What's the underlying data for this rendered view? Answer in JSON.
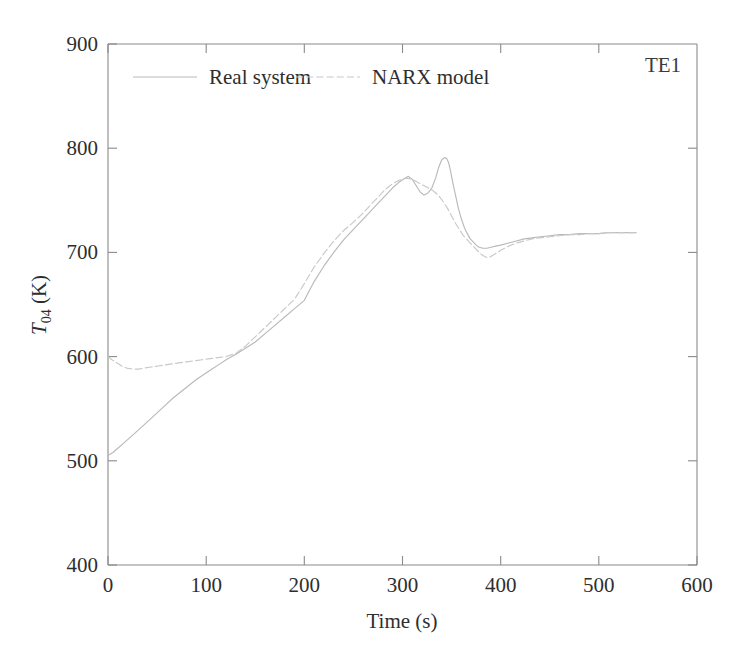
{
  "chart_data": {
    "type": "line",
    "title": "",
    "xlabel": "Time (s)",
    "ylabel": "T_04 (K)",
    "ylabel_base": "T",
    "ylabel_sub": "04",
    "ylabel_unit": " (K)",
    "xlim": [
      0,
      600
    ],
    "ylim": [
      400,
      900
    ],
    "xticks": [
      0,
      100,
      200,
      300,
      400,
      500,
      600
    ],
    "yticks": [
      400,
      500,
      600,
      700,
      800,
      900
    ],
    "grid": false,
    "legend_position": "top-center-inside",
    "annotations": [
      {
        "text": "TE1",
        "x": 560,
        "y": 870
      }
    ],
    "series": [
      {
        "name": "Real system",
        "style": "solid",
        "color": "#b9b9b9",
        "x": [
          0,
          5,
          10,
          16,
          22,
          28,
          35,
          42,
          50,
          58,
          66,
          74,
          82,
          90,
          98,
          106,
          114,
          122,
          130,
          140,
          150,
          160,
          170,
          180,
          190,
          200,
          210,
          220,
          230,
          240,
          250,
          258,
          266,
          274,
          282,
          290,
          296,
          302,
          306,
          310,
          314,
          318,
          322,
          326,
          330,
          334,
          337,
          340,
          343,
          345,
          347,
          349,
          351,
          354,
          357,
          360,
          363,
          366,
          369,
          372,
          375,
          378,
          382,
          386,
          390,
          395,
          400,
          408,
          416,
          424,
          432,
          440,
          450,
          460,
          470,
          480,
          490,
          500,
          510,
          520,
          530,
          538
        ],
        "y": [
          505,
          508,
          512,
          517,
          522,
          527,
          533,
          539,
          546,
          553,
          560,
          566,
          572,
          578,
          583,
          588,
          593,
          598,
          602,
          608,
          614,
          622,
          630,
          638,
          646,
          654,
          672,
          687,
          700,
          712,
          722,
          730,
          738,
          746,
          754,
          762,
          767,
          771,
          773,
          770,
          764,
          758,
          755,
          757,
          762,
          772,
          782,
          789,
          791,
          790,
          786,
          778,
          768,
          755,
          742,
          732,
          724,
          718,
          713,
          710,
          707,
          705,
          704,
          704,
          705,
          706,
          707,
          709,
          711,
          713,
          714,
          715,
          716,
          717,
          717,
          718,
          718,
          718,
          719,
          719,
          719,
          719
        ]
      },
      {
        "name": "NARX model",
        "style": "dashed",
        "color": "#c8c8c8",
        "x": [
          0,
          4,
          9,
          14,
          19,
          25,
          31,
          37,
          44,
          51,
          58,
          65,
          72,
          80,
          88,
          96,
          104,
          112,
          120,
          130,
          140,
          150,
          160,
          170,
          180,
          190,
          200,
          210,
          220,
          230,
          240,
          250,
          258,
          266,
          274,
          282,
          290,
          296,
          302,
          306,
          310,
          314,
          318,
          322,
          326,
          330,
          334,
          338,
          342,
          346,
          350,
          354,
          358,
          362,
          366,
          370,
          374,
          378,
          382,
          386,
          390,
          395,
          400,
          408,
          416,
          424,
          432,
          440,
          450,
          460,
          470,
          480,
          490,
          500,
          510,
          520,
          530,
          538
        ],
        "y": [
          600,
          597,
          594,
          591,
          589,
          588,
          588,
          589,
          590,
          591,
          592,
          593,
          594,
          595,
          596,
          597,
          598,
          599,
          600,
          603,
          610,
          619,
          628,
          637,
          646,
          655,
          670,
          686,
          699,
          711,
          721,
          729,
          736,
          744,
          752,
          760,
          766,
          769,
          771,
          771,
          770,
          768,
          766,
          764,
          762,
          760,
          757,
          753,
          748,
          742,
          735,
          728,
          722,
          716,
          712,
          708,
          704,
          700,
          697,
          695,
          696,
          699,
          702,
          706,
          709,
          711,
          713,
          714,
          715,
          716,
          717,
          717,
          718,
          718,
          719,
          719,
          719,
          719
        ]
      }
    ]
  },
  "legend": {
    "items": [
      {
        "label": "Real system",
        "style": "solid"
      },
      {
        "label": "NARX model",
        "style": "dashed"
      }
    ]
  },
  "axes": {
    "x_tick_labels": [
      "0",
      "100",
      "200",
      "300",
      "400",
      "500",
      "600"
    ],
    "y_tick_labels": [
      "400",
      "500",
      "600",
      "700",
      "800",
      "900"
    ],
    "x_title": "Time (s)",
    "y_title_base": "T",
    "y_title_sub": "04",
    "y_title_unit": "(K)"
  },
  "annotation": {
    "label": "TE1"
  }
}
